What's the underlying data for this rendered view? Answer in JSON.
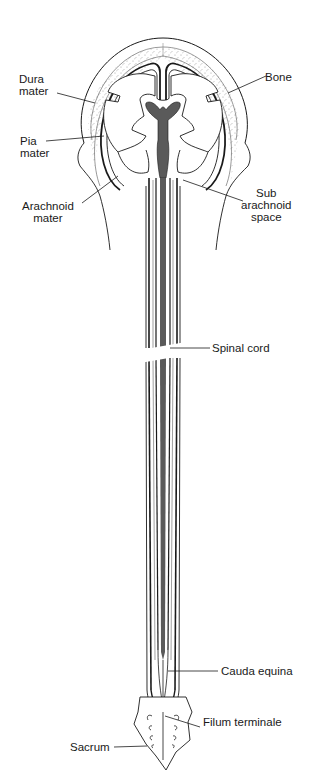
{
  "diagram": {
    "type": "anatomical-illustration",
    "colors": {
      "outline": "#1a1a1a",
      "ventricle_fill": "#5a5a5a",
      "bone_stipple": "#9a9a9a",
      "background": "#ffffff"
    }
  },
  "labels": {
    "dura_mater": {
      "line1": "Dura",
      "line2": "mater"
    },
    "pia_mater": {
      "line1": "Pia",
      "line2": "mater"
    },
    "arachnoid_mater": {
      "line1": "Arachnoid",
      "line2": "mater"
    },
    "bone": {
      "line1": "Bone"
    },
    "sub_arachnoid_space": {
      "line1": "Sub",
      "line2": "arachnoid",
      "line3": "space"
    },
    "spinal_cord": {
      "line1": "Spinal cord"
    },
    "cauda_equina": {
      "line1": "Cauda equina"
    },
    "filum_terminale": {
      "line1": "Filum terminale"
    },
    "sacrum": {
      "line1": "Sacrum"
    }
  }
}
